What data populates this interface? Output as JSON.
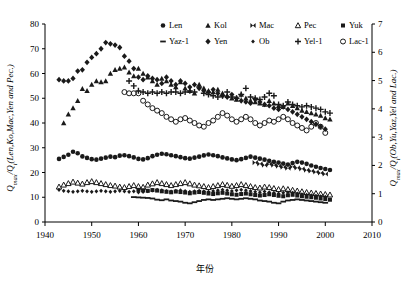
{
  "figure": {
    "xlabel": "年份",
    "ylabel_left": "Q",
    "ylabel_left_sub": "max",
    "ylabel_left_rest": "/Q",
    "ylabel_left_sub2": "i",
    "ylabel_left_tail": "(Len,Ko,Mac,Yen and Pec.)",
    "ylabel_left_full": "Qmax/Qi(Len,Ko,Mac,Yen and Pec.)",
    "ylabel_right_full": "Qmax/Qi(Ob,Yu,Yaz,Yel and Lac.)",
    "ylabel_right_tail": "(Ob,Yu,Yaz,Yel and Lac.)"
  },
  "chart_data": {
    "type": "scatter",
    "title": "",
    "xlabel": "年份",
    "ylabel": "Qmax/Qi(Len,Ko,Mac,Yen and Pec.)",
    "ylabel_right": "Qmax/Qi(Ob,Yu,Yaz,Yel and Lac.)",
    "xlim": [
      1940,
      2010
    ],
    "ylim": [
      0,
      80
    ],
    "ylim_right": [
      0,
      7
    ],
    "xticks": [
      1940,
      1950,
      1960,
      1970,
      1980,
      1990,
      2000,
      2010
    ],
    "yticks": [
      0,
      10,
      20,
      30,
      40,
      50,
      60,
      70,
      80
    ],
    "yticks_right": [
      0,
      1,
      2,
      3,
      4,
      5,
      6,
      7
    ],
    "grid": false,
    "legend_position": "top-right",
    "series": [
      {
        "name": "Len",
        "marker": "filled-circle",
        "axis": "left",
        "x": [
          1943,
          1944,
          1945,
          1946,
          1947,
          1948,
          1949,
          1950,
          1951,
          1952,
          1953,
          1954,
          1955,
          1956,
          1957,
          1958,
          1959,
          1960,
          1961,
          1962,
          1963,
          1964,
          1965,
          1966,
          1967,
          1968,
          1969,
          1970,
          1971,
          1972,
          1973,
          1974,
          1975,
          1976,
          1977,
          1978,
          1979,
          1980,
          1981,
          1982,
          1983,
          1984,
          1985,
          1986,
          1987,
          1988,
          1989,
          1990,
          1991,
          1992,
          1993,
          1994,
          1995,
          1996,
          1997,
          1998,
          1999,
          2000,
          2001
        ],
        "y": [
          25.5,
          26.3,
          27.2,
          28.4,
          27.8,
          26.5,
          25.9,
          25.4,
          25.2,
          25.6,
          26.0,
          26.4,
          26.2,
          26.8,
          27.0,
          26.6,
          26.1,
          25.5,
          25.3,
          25.8,
          26.6,
          27.2,
          27.6,
          27.4,
          27.0,
          26.6,
          26.2,
          25.8,
          25.6,
          26.0,
          26.4,
          26.9,
          27.3,
          27.0,
          26.6,
          26.1,
          25.7,
          25.3,
          25.0,
          25.4,
          25.9,
          26.4,
          26.0,
          25.6,
          25.2,
          24.7,
          24.3,
          24.0,
          23.6,
          23.2,
          23.8,
          24.3,
          24.0,
          23.5,
          22.8,
          22.3,
          21.8,
          21.4,
          21.0
        ]
      },
      {
        "name": "Kol",
        "marker": "filled-triangle",
        "axis": "left",
        "x": [
          1944,
          1945,
          1946,
          1947,
          1948,
          1949,
          1950,
          1951,
          1952,
          1953,
          1954,
          1955,
          1956,
          1957,
          1958,
          1959,
          1960,
          1961,
          1962,
          1963,
          1964,
          1965,
          1966,
          1967,
          1968,
          1969,
          1970,
          1971,
          1972,
          1973,
          1974,
          1975,
          1976,
          1977,
          1978,
          1979,
          1980,
          1981,
          1982,
          1983,
          1984,
          1985,
          1986,
          1987,
          1988,
          1989,
          1990,
          1991,
          1992,
          1993,
          1994,
          1995,
          1996,
          1997,
          1998,
          1999,
          2000,
          2001
        ],
        "y": [
          40.0,
          43.5,
          46.0,
          49.0,
          53.8,
          53.0,
          55.5,
          57.0,
          56.5,
          57.0,
          60.0,
          61.5,
          62.0,
          62.5,
          60.5,
          59.0,
          62.0,
          60.0,
          58.5,
          57.0,
          55.5,
          58.0,
          57.0,
          55.5,
          54.5,
          56.5,
          54.0,
          53.0,
          52.0,
          55.5,
          54.0,
          53.0,
          52.5,
          53.5,
          52.0,
          51.0,
          50.0,
          49.5,
          51.5,
          50.0,
          49.0,
          48.5,
          48.0,
          47.5,
          49.0,
          48.0,
          47.0,
          46.5,
          48.0,
          47.0,
          46.0,
          45.0,
          44.5,
          44.0,
          43.5,
          43.0,
          42.0,
          41.5
        ]
      },
      {
        "name": "Mac",
        "marker": "bowtie",
        "axis": "left",
        "x": [
          1985,
          1986,
          1987,
          1988,
          1989,
          1990,
          1991,
          1992,
          1993,
          1994,
          1995,
          1996,
          1997,
          1998,
          1999,
          2000
        ],
        "y": [
          24.0,
          23.5,
          23.0,
          23.4,
          23.0,
          22.6,
          22.2,
          21.8,
          22.3,
          21.9,
          21.5,
          21.0,
          20.6,
          20.2,
          19.8,
          19.4
        ]
      },
      {
        "name": "Pec",
        "marker": "open-triangle",
        "axis": "left",
        "x": [
          1943,
          1944,
          1945,
          1946,
          1947,
          1948,
          1949,
          1950,
          1951,
          1952,
          1953,
          1954,
          1955,
          1956,
          1957,
          1958,
          1959,
          1960,
          1961,
          1962,
          1963,
          1964,
          1965,
          1966,
          1967,
          1968,
          1969,
          1970,
          1971,
          1972,
          1973,
          1974,
          1975,
          1976,
          1977,
          1978,
          1979,
          1980,
          1981,
          1982,
          1983,
          1984,
          1985,
          1986,
          1987,
          1988,
          1989,
          1990,
          1991,
          1992,
          1993,
          1994,
          1995,
          1996,
          1997,
          1998,
          1999,
          2000,
          2001
        ],
        "y": [
          14.2,
          15.0,
          15.6,
          16.2,
          15.8,
          15.4,
          16.0,
          16.4,
          16.0,
          15.6,
          15.2,
          14.8,
          14.6,
          14.2,
          14.0,
          14.4,
          14.8,
          14.4,
          14.1,
          15.0,
          15.5,
          16.0,
          15.6,
          15.2,
          14.8,
          15.2,
          15.6,
          16.0,
          15.5,
          15.0,
          14.7,
          14.4,
          14.0,
          14.4,
          14.8,
          15.2,
          14.9,
          14.5,
          14.8,
          15.2,
          14.8,
          14.4,
          14.0,
          13.8,
          14.2,
          14.0,
          13.6,
          13.2,
          13.5,
          13.2,
          12.9,
          12.6,
          12.3,
          12.0,
          11.8,
          11.6,
          11.4,
          11.2,
          11.0
        ]
      },
      {
        "name": "Yuk",
        "marker": "filled-square",
        "axis": "left",
        "x": [
          1960,
          1961,
          1962,
          1963,
          1964,
          1965,
          1966,
          1967,
          1968,
          1969,
          1970,
          1971,
          1972,
          1973,
          1974,
          1975,
          1976,
          1977,
          1978,
          1979,
          1980,
          1981,
          1982,
          1983,
          1984,
          1985,
          1986,
          1987,
          1988,
          1989,
          1990,
          1991,
          1992,
          1993,
          1994,
          1995,
          1996,
          1997,
          1998,
          1999,
          2000,
          2001
        ],
        "y": [
          13.0,
          12.8,
          12.6,
          12.9,
          12.7,
          12.4,
          12.2,
          12.0,
          12.3,
          12.1,
          11.9,
          11.6,
          11.9,
          12.1,
          11.8,
          11.5,
          11.3,
          11.6,
          11.8,
          11.5,
          11.2,
          11.0,
          11.3,
          11.5,
          11.2,
          10.9,
          10.7,
          10.9,
          11.2,
          10.9,
          10.6,
          10.4,
          10.8,
          11.0,
          10.7,
          10.4,
          10.2,
          10.0,
          9.8,
          9.5,
          9.3,
          9.0
        ]
      },
      {
        "name": "Yaz-1",
        "marker": "dash",
        "axis": "right",
        "x": [
          1959,
          1960,
          1961,
          1962,
          1963,
          1964,
          1965,
          1966,
          1967,
          1968,
          1969,
          1970,
          1971,
          1972,
          1973,
          1974,
          1975,
          1976,
          1977,
          1978,
          1979,
          1980,
          1981,
          1982,
          1983,
          1984,
          1985,
          1986,
          1987,
          1988,
          1989,
          1990,
          1991,
          1992,
          1993,
          1994,
          1995,
          1996,
          1997,
          1998,
          1999,
          2000
        ],
        "y": [
          0.88,
          0.87,
          0.86,
          0.85,
          0.83,
          0.79,
          0.77,
          0.8,
          0.76,
          0.74,
          0.72,
          0.68,
          0.66,
          0.7,
          0.74,
          0.78,
          0.8,
          0.78,
          0.8,
          0.82,
          0.84,
          0.82,
          0.8,
          0.82,
          0.84,
          0.82,
          0.8,
          0.76,
          0.74,
          0.72,
          0.68,
          0.66,
          0.72,
          0.76,
          0.78,
          0.8,
          0.78,
          0.76,
          0.74,
          0.72,
          0.7,
          0.68
        ]
      },
      {
        "name": "Yen",
        "marker": "filled-diamond",
        "axis": "left",
        "x": [
          1943,
          1944,
          1945,
          1946,
          1947,
          1948,
          1949,
          1950,
          1951,
          1952,
          1953,
          1954,
          1955,
          1956,
          1957,
          1958,
          1959,
          1960,
          1961,
          1962,
          1963,
          1964,
          1965,
          1966,
          1967,
          1968,
          1969,
          1970,
          1971,
          1972,
          1973,
          1974,
          1975,
          1976,
          1977,
          1978,
          1979,
          1980,
          1981,
          1982,
          1983,
          1984,
          1985,
          1986,
          1987,
          1988,
          1989,
          1990,
          1991,
          1992,
          1993,
          1994,
          1995,
          1996,
          1997,
          1998,
          1999,
          2000
        ],
        "y": [
          57.5,
          57.0,
          57.0,
          58.0,
          61.0,
          61.5,
          64.5,
          66.5,
          68.0,
          70.0,
          72.5,
          72.0,
          71.5,
          70.5,
          67.0,
          65.0,
          62.0,
          58.5,
          57.5,
          59.0,
          58.0,
          57.5,
          56.0,
          58.5,
          57.0,
          55.5,
          57.0,
          56.0,
          54.5,
          55.5,
          54.0,
          53.0,
          52.5,
          53.5,
          52.0,
          51.0,
          50.5,
          51.5,
          50.0,
          49.0,
          48.5,
          48.0,
          49.5,
          48.5,
          47.5,
          47.0,
          46.0,
          45.5,
          46.5,
          45.5,
          44.5,
          43.5,
          42.5,
          41.5,
          40.5,
          39.5,
          38.5,
          37.5
        ]
      },
      {
        "name": "Ob",
        "marker": "filled-diamond-sm",
        "axis": "left",
        "x": [
          1943,
          1944,
          1945,
          1946,
          1947,
          1948,
          1949,
          1950,
          1951,
          1952,
          1953,
          1954,
          1955,
          1956,
          1957,
          1958,
          1959,
          1960,
          1961,
          1962,
          1963,
          1964,
          1965,
          1966,
          1967,
          1968,
          1969,
          1970,
          1971,
          1972,
          1973,
          1974,
          1975,
          1976,
          1977,
          1978,
          1979,
          1980,
          1981,
          1982,
          1983,
          1984,
          1985,
          1986,
          1987,
          1988,
          1989,
          1990,
          1991,
          1992,
          1993,
          1994,
          1995,
          1996,
          1997,
          1998,
          1999,
          2000
        ],
        "y": [
          13.0,
          12.6,
          12.4,
          12.2,
          12.4,
          12.6,
          12.4,
          12.2,
          12.4,
          12.6,
          12.4,
          12.2,
          12.4,
          12.6,
          12.4,
          12.2,
          12.4,
          12.0,
          12.2,
          12.5,
          12.8,
          13.0,
          12.8,
          12.5,
          12.3,
          12.6,
          12.8,
          12.5,
          12.2,
          12.4,
          12.6,
          12.4,
          12.2,
          12.5,
          12.8,
          13.0,
          12.8,
          12.5,
          12.8,
          13.0,
          12.8,
          12.5,
          12.2,
          12.0,
          12.3,
          12.0,
          11.8,
          11.5,
          11.8,
          12.0,
          11.8,
          11.5,
          11.2,
          11.0,
          10.8,
          10.6,
          10.4,
          10.2
        ]
      },
      {
        "name": "Yel-1",
        "marker": "plus",
        "axis": "left",
        "x": [
          1958,
          1959,
          1960,
          1961,
          1962,
          1963,
          1964,
          1965,
          1966,
          1967,
          1968,
          1969,
          1970,
          1971,
          1972,
          1973,
          1974,
          1975,
          1976,
          1977,
          1978,
          1979,
          1980,
          1981,
          1982,
          1983,
          1984,
          1985,
          1986,
          1987,
          1988,
          1989,
          1990,
          1991,
          1992,
          1993,
          1994,
          1995,
          1996,
          1997,
          1998,
          1999,
          2000,
          2001
        ],
        "y": [
          57.0,
          55.0,
          53.0,
          52.5,
          52.0,
          52.5,
          52.0,
          52.5,
          52.0,
          52.5,
          52.5,
          52.0,
          52.5,
          53.0,
          52.5,
          54.5,
          52.0,
          51.5,
          51.0,
          50.5,
          51.0,
          52.5,
          50.5,
          50.0,
          51.5,
          54.0,
          50.5,
          50.0,
          49.5,
          50.5,
          52.0,
          51.0,
          47.5,
          47.0,
          48.5,
          47.5,
          47.0,
          46.5,
          47.0,
          46.5,
          46.0,
          45.5,
          44.5,
          44.0
        ]
      },
      {
        "name": "Lac-1",
        "marker": "open-circle",
        "axis": "left",
        "x": [
          1957,
          1958,
          1959,
          1960,
          1961,
          1962,
          1963,
          1964,
          1965,
          1966,
          1967,
          1968,
          1969,
          1970,
          1971,
          1972,
          1973,
          1974,
          1975,
          1976,
          1977,
          1978,
          1979,
          1980,
          1981,
          1982,
          1983,
          1984,
          1985,
          1986,
          1987,
          1988,
          1989,
          1990,
          1991,
          1992,
          1993,
          1994,
          1995,
          1996,
          1997,
          1998,
          1999,
          2000
        ],
        "y": [
          52.5,
          52.0,
          52.0,
          52.0,
          49.0,
          47.5,
          46.0,
          45.0,
          44.0,
          42.5,
          41.5,
          40.5,
          41.5,
          42.0,
          41.0,
          40.0,
          39.0,
          38.5,
          40.0,
          41.0,
          42.5,
          44.0,
          43.0,
          41.5,
          40.5,
          41.5,
          42.5,
          41.5,
          40.0,
          39.0,
          40.0,
          41.0,
          40.5,
          41.5,
          42.5,
          41.5,
          40.0,
          39.0,
          38.0,
          37.0,
          38.5,
          40.0,
          38.5,
          36.0
        ]
      }
    ],
    "legend": [
      {
        "label": "Len",
        "marker": "filled-circle"
      },
      {
        "label": "Kol",
        "marker": "filled-triangle"
      },
      {
        "label": "Mac",
        "marker": "bowtie"
      },
      {
        "label": "Pec",
        "marker": "open-triangle"
      },
      {
        "label": "Yuk",
        "marker": "filled-square"
      },
      {
        "label": "Yaz-1",
        "marker": "dash"
      },
      {
        "label": "Yen",
        "marker": "filled-diamond"
      },
      {
        "label": "Ob",
        "marker": "filled-diamond-sm"
      },
      {
        "label": "Yel-1",
        "marker": "plus"
      },
      {
        "label": "Lac-1",
        "marker": "open-circle"
      }
    ]
  }
}
